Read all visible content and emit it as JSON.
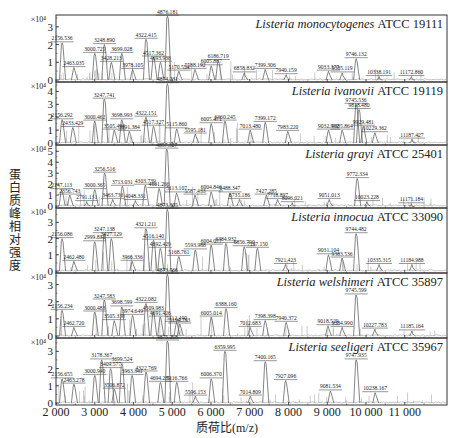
{
  "chart_data": {
    "type": "line",
    "title": "",
    "xlabel": "质荷比(m/z)",
    "ylabel": "蛋白质峰相对强度",
    "xlim": [
      2000,
      12150
    ],
    "x_ticks": [
      2000,
      3000,
      4000,
      5000,
      6000,
      7000,
      8000,
      9000,
      10000,
      11000
    ],
    "x_tick_labels": [
      "2 000",
      "3 000",
      "4 000",
      "5 000",
      "6 000",
      "7 000",
      "8 000",
      "9 000",
      "10 000",
      "11 000"
    ],
    "y_multiplier": "×10⁴",
    "grid": false,
    "panels": [
      {
        "species": "Listeria monocytogenes",
        "strain": "ATCC 19111",
        "ymax": 3.5,
        "y_ticks": [
          0,
          1,
          2,
          3
        ],
        "peaks": [
          {
            "mz": 2156.536,
            "label": "2156.536",
            "h": 2.1
          },
          {
            "mz": 2463.035,
            "label": "2463.035",
            "h": 0.7
          },
          {
            "mz": 3000.725,
            "label": "3000.725",
            "h": 1.5
          },
          {
            "mz": 3248.89,
            "label": "3248.890",
            "h": 2.0
          },
          {
            "mz": 3428.213,
            "label": "3428.213",
            "h": 1.0
          },
          {
            "mz": 3699.028,
            "label": "3699.028",
            "h": 1.5
          },
          {
            "mz": 3978.105,
            "label": "3978.105",
            "h": 0.6
          },
          {
            "mz": 4322.415,
            "label": "4322.415",
            "h": 2.3
          },
          {
            "mz": 4517.362,
            "label": "4517.362",
            "h": 1.3
          },
          {
            "mz": 4693.938,
            "label": "4693.938",
            "h": 1.0
          },
          {
            "mz": 4876.181,
            "label": "4876.181",
            "h": 3.6
          },
          {
            "mz": 5170.554,
            "label": "5170.554",
            "h": 0.5
          },
          {
            "mz": 5588.192,
            "label": "5588.192",
            "h": 0.6
          },
          {
            "mz": 6005.887,
            "label": "6005.887",
            "h": 0.8
          },
          {
            "mz": 6186.719,
            "label": "6186.719",
            "h": 1.1
          },
          {
            "mz": 6858.832,
            "label": "6858.832",
            "h": 0.4
          },
          {
            "mz": 7399.306,
            "label": "7399.306",
            "h": 0.6
          },
          {
            "mz": 7940.159,
            "label": "7940.159",
            "h": 0.3
          },
          {
            "mz": 9033.377,
            "label": "9033.377",
            "h": 0.5
          },
          {
            "mz": 9385.119,
            "label": "9385.119",
            "h": 0.4
          },
          {
            "mz": 9746.132,
            "label": "9746.132",
            "h": 1.2
          },
          {
            "mz": 10338.191,
            "label": "10338.191",
            "h": 0.2
          },
          {
            "mz": 11172.86,
            "label": "11172.860",
            "h": 0.2
          }
        ]
      },
      {
        "species": "Listeria ivanovii",
        "strain": "ATCC 19119",
        "ymax": 4.5,
        "y_ticks": [
          0,
          1,
          2,
          3,
          4
        ],
        "peaks": [
          {
            "mz": 2156.292,
            "label": "2156.292",
            "h": 1.8
          },
          {
            "mz": 2433.429,
            "label": "2433.429",
            "h": 1.2
          },
          {
            "mz": 3000.462,
            "label": "3000.462",
            "h": 1.7
          },
          {
            "mz": 3247.741,
            "label": "3247.741",
            "h": 3.4
          },
          {
            "mz": 3505.493,
            "label": "3505.493",
            "h": 1.0
          },
          {
            "mz": 3698.993,
            "label": "3698.993",
            "h": 1.8
          },
          {
            "mz": 3891.384,
            "label": "3891.384",
            "h": 0.9
          },
          {
            "mz": 4322.151,
            "label": "4322.151",
            "h": 2.0
          },
          {
            "mz": 4517.327,
            "label": "4517.327",
            "h": 1.3
          },
          {
            "mz": 4874.231,
            "label": "4874.231",
            "h": 4.6
          },
          {
            "mz": 5115.86,
            "label": "5115.860",
            "h": 1.1
          },
          {
            "mz": 5595.181,
            "label": "5595.181",
            "h": 0.7
          },
          {
            "mz": 6005.471,
            "label": "6005.471",
            "h": 1.5
          },
          {
            "mz": 6360.245,
            "label": "6360.245",
            "h": 1.7
          },
          {
            "mz": 7013.48,
            "label": "7013.480",
            "h": 1.0
          },
          {
            "mz": 7399.172,
            "label": "7399.172",
            "h": 1.6
          },
          {
            "mz": 7983.22,
            "label": "7983.220",
            "h": 0.9
          },
          {
            "mz": 9032.992,
            "label": "9032.992",
            "h": 1.0
          },
          {
            "mz": 9385.864,
            "label": "9385.864",
            "h": 1.0
          },
          {
            "mz": 9745.536,
            "label": "9745.536",
            "h": 3.0
          },
          {
            "mz": 9818.48,
            "label": "9818.480",
            "h": 2.6
          },
          {
            "mz": 9929.481,
            "label": "9929.481",
            "h": 1.3
          },
          {
            "mz": 10229.362,
            "label": "10229.362",
            "h": 0.8
          },
          {
            "mz": 11187.427,
            "label": "11187.427",
            "h": 0.3
          }
        ]
      },
      {
        "species": "Listeria grayi",
        "strain": "ATCC 25401",
        "ymax": 5.3,
        "y_ticks": [
          0,
          1,
          2,
          3,
          4,
          5
        ],
        "peaks": [
          {
            "mz": 2147.113,
            "label": "2147.113",
            "h": 1.5
          },
          {
            "mz": 2356.743,
            "label": "2356.743",
            "h": 1.0
          },
          {
            "mz": 2791.131,
            "label": "2791.131",
            "h": 0.4
          },
          {
            "mz": 3000.365,
            "label": "3000.365",
            "h": 1.5
          },
          {
            "mz": 3256.516,
            "label": "3256.516",
            "h": 3.0
          },
          {
            "mz": 3463.736,
            "label": "3463.736",
            "h": 0.6
          },
          {
            "mz": 3713.031,
            "label": "3713.031",
            "h": 1.8
          },
          {
            "mz": 4048.331,
            "label": "4048.331",
            "h": 0.5
          },
          {
            "mz": 4303.739,
            "label": "4303.739",
            "h": 1.9
          },
          {
            "mz": 4661.266,
            "label": "4661.266",
            "h": 1.6
          },
          {
            "mz": 4857.327,
            "label": "4857.327",
            "h": 5.2
          },
          {
            "mz": 5113.107,
            "label": "5113.107",
            "h": 1.2
          },
          {
            "mz": 5587.433,
            "label": "5587.433",
            "h": 1.0
          },
          {
            "mz": 6004.846,
            "label": "6004.846",
            "h": 1.3
          },
          {
            "mz": 6488.347,
            "label": "6488.347",
            "h": 1.2
          },
          {
            "mz": 6735.186,
            "label": "6735.186",
            "h": 0.6
          },
          {
            "mz": 7427.285,
            "label": "7427.285",
            "h": 1.0
          },
          {
            "mz": 7718.897,
            "label": "7718.897",
            "h": 0.6
          },
          {
            "mz": 8096.021,
            "label": "8096.021",
            "h": 0.3
          },
          {
            "mz": 9051.013,
            "label": "9051.013",
            "h": 0.6
          },
          {
            "mz": 9772.334,
            "label": "9772.334",
            "h": 2.5
          },
          {
            "mz": 10023.228,
            "label": "10023.228",
            "h": 0.4
          },
          {
            "mz": 11171.184,
            "label": "11171.184",
            "h": 0.2
          }
        ]
      },
      {
        "species": "Listeria innocua",
        "strain": "ATCC 33090",
        "ymax": 3.7,
        "y_ticks": [
          0,
          1,
          2,
          3
        ],
        "peaks": [
          {
            "mz": 2156.086,
            "label": "2156.086",
            "h": 2.0
          },
          {
            "mz": 2462.48,
            "label": "2462.480",
            "h": 0.6
          },
          {
            "mz": 2999.832,
            "label": "2999.832",
            "h": 1.8
          },
          {
            "mz": 3247.138,
            "label": "3247.138",
            "h": 2.3
          },
          {
            "mz": 3427.129,
            "label": "3427.129",
            "h": 2.0
          },
          {
            "mz": 3966.336,
            "label": "3966.336",
            "h": 0.6
          },
          {
            "mz": 4321.211,
            "label": "4321.211",
            "h": 2.6
          },
          {
            "mz": 4516.14,
            "label": "4516.140",
            "h": 1.9
          },
          {
            "mz": 4692.429,
            "label": "4692.429",
            "h": 1.4
          },
          {
            "mz": 4873.305,
            "label": "4873.305",
            "h": 3.8
          },
          {
            "mz": 5168.761,
            "label": "5168.761",
            "h": 0.9
          },
          {
            "mz": 5593.988,
            "label": "5593.988",
            "h": 1.3
          },
          {
            "mz": 6004.077,
            "label": "6004.077",
            "h": 1.6
          },
          {
            "mz": 6384.932,
            "label": "6384.932",
            "h": 1.7
          },
          {
            "mz": 6856.79,
            "label": "6856.790",
            "h": 1.5
          },
          {
            "mz": 7197.15,
            "label": "7197.150",
            "h": 1.4
          },
          {
            "mz": 7921.423,
            "label": "7921.423",
            "h": 0.4
          },
          {
            "mz": 9031.104,
            "label": "9031.104",
            "h": 1.0
          },
          {
            "mz": 9383.536,
            "label": "9383.536",
            "h": 0.8
          },
          {
            "mz": 9744.482,
            "label": "9744.482",
            "h": 2.3
          },
          {
            "mz": 10335.315,
            "label": "10335.315",
            "h": 0.4
          },
          {
            "mz": 11184.988,
            "label": "11184.988",
            "h": 0.4
          }
        ]
      },
      {
        "species": "Listeria welshimeri",
        "strain": "ATCC 35897",
        "ymax": 3.5,
        "y_ticks": [
          0,
          1,
          2,
          3
        ],
        "peaks": [
          {
            "mz": 2156.234,
            "label": "2156.234",
            "h": 1.5
          },
          {
            "mz": 2462.72,
            "label": "2462.720",
            "h": 0.5
          },
          {
            "mz": 3000.483,
            "label": "3000.483",
            "h": 1.4
          },
          {
            "mz": 3247.583,
            "label": "3247.583",
            "h": 2.1
          },
          {
            "mz": 3505.338,
            "label": "3505.338",
            "h": 0.9
          },
          {
            "mz": 3698.599,
            "label": "3698.599",
            "h": 1.7
          },
          {
            "mz": 3974.649,
            "label": "3974.649",
            "h": 1.2
          },
          {
            "mz": 4322.082,
            "label": "4322.082",
            "h": 1.9
          },
          {
            "mz": 4509.983,
            "label": "4509.983",
            "h": 1.4
          },
          {
            "mz": 4691.426,
            "label": "4691.426",
            "h": 1.1
          },
          {
            "mz": 4873.566,
            "label": "4873.566",
            "h": 3.6
          },
          {
            "mz": 5112.49,
            "label": "5112.490",
            "h": 0.8
          },
          {
            "mz": 5194.793,
            "label": "5194.793",
            "h": 0.7
          },
          {
            "mz": 6005.014,
            "label": "6005.014",
            "h": 1.1
          },
          {
            "mz": 6388.16,
            "label": "6388.160",
            "h": 1.6
          },
          {
            "mz": 7012.683,
            "label": "7012.683",
            "h": 0.5
          },
          {
            "mz": 7398.398,
            "label": "7398.398",
            "h": 0.9
          },
          {
            "mz": 7940.372,
            "label": "7940.372",
            "h": 0.8
          },
          {
            "mz": 9018.529,
            "label": "9018.529",
            "h": 0.6
          },
          {
            "mz": 9384.99,
            "label": "9384.990",
            "h": 0.5
          },
          {
            "mz": 9745.599,
            "label": "9745.599",
            "h": 2.4
          },
          {
            "mz": 10227.783,
            "label": "10227.783",
            "h": 0.4
          },
          {
            "mz": 11185.164,
            "label": "11185.164",
            "h": 0.3
          }
        ]
      },
      {
        "species": "Listeria seeligeri",
        "strain": "ATCC 35967",
        "ymax": 3.6,
        "y_ticks": [
          0,
          1,
          2,
          3
        ],
        "peaks": [
          {
            "mz": 2156.655,
            "label": "2156.655",
            "h": 1.4
          },
          {
            "mz": 2463.278,
            "label": "2463.278",
            "h": 1.1
          },
          {
            "mz": 3000.94,
            "label": "3000.940",
            "h": 1.6
          },
          {
            "mz": 3178.367,
            "label": "3178.367",
            "h": 2.5
          },
          {
            "mz": 3409.577,
            "label": "3409.577",
            "h": 2.0
          },
          {
            "mz": 3506.872,
            "label": "3506.872",
            "h": 0.8
          },
          {
            "mz": 3699.524,
            "label": "3699.524",
            "h": 2.3
          },
          {
            "mz": 3963.341,
            "label": "3963.341",
            "h": 1.6
          },
          {
            "mz": 4322.769,
            "label": "4322.769",
            "h": 1.8
          },
          {
            "mz": 4694.289,
            "label": "4694.289",
            "h": 1.2
          },
          {
            "mz": 4875.218,
            "label": "4875.218",
            "h": 3.6
          },
          {
            "mz": 5116.766,
            "label": "5116.766",
            "h": 1.2
          },
          {
            "mz": 5596.153,
            "label": "5596.153",
            "h": 0.4
          },
          {
            "mz": 6006.37,
            "label": "6006.370",
            "h": 1.4
          },
          {
            "mz": 6359.995,
            "label": "6359.995",
            "h": 3.0
          },
          {
            "mz": 7014.809,
            "label": "7014.809",
            "h": 0.4
          },
          {
            "mz": 7400.165,
            "label": "7400.165",
            "h": 2.4
          },
          {
            "mz": 7927.096,
            "label": "7927.096",
            "h": 1.3
          },
          {
            "mz": 9081.534,
            "label": "9081.534",
            "h": 0.7
          },
          {
            "mz": 9747.935,
            "label": "9747.935",
            "h": 2.5
          },
          {
            "mz": 10238.167,
            "label": "10238.167",
            "h": 0.6
          }
        ]
      }
    ]
  }
}
